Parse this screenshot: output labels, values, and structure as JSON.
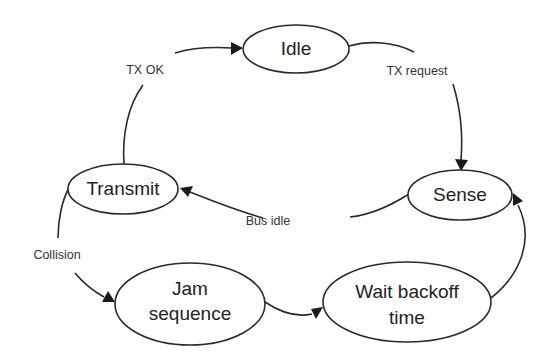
{
  "diagram": {
    "type": "state-machine",
    "nodes": {
      "idle": {
        "label": "Idle"
      },
      "sense": {
        "label": "Sense"
      },
      "transmit": {
        "label": "Transmit"
      },
      "jam": {
        "line1": "Jam",
        "line2": "sequence"
      },
      "wait": {
        "line1": "Wait backoff",
        "line2": "time"
      }
    },
    "edges": {
      "tx_request": {
        "from": "Idle",
        "to": "Sense",
        "label": "TX request"
      },
      "bus_idle": {
        "from": "Sense",
        "to": "Transmit",
        "label": "Bus idle"
      },
      "tx_ok": {
        "from": "Transmit",
        "to": "Idle",
        "label": "TX OK"
      },
      "collision": {
        "from": "Transmit",
        "to": "Jam sequence",
        "label": "Collision"
      },
      "jam_to_wait": {
        "from": "Jam sequence",
        "to": "Wait backoff time",
        "label": ""
      },
      "wait_to_sense": {
        "from": "Wait backoff time",
        "to": "Sense",
        "label": ""
      }
    },
    "colors": {
      "stroke": "#2a2a2a",
      "text": "#222222",
      "background": "#ffffff"
    }
  }
}
